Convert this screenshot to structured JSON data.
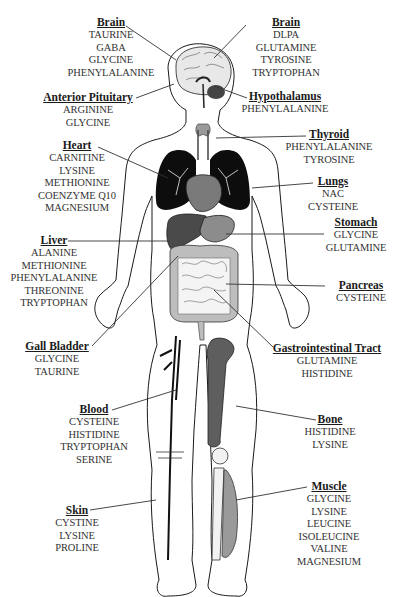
{
  "colors": {
    "outline": "#1a1a1a",
    "lungs": "#0d0d0d",
    "heart": "#7a7a7a",
    "liver": "#4a4a4a",
    "stomach": "#8c8c8c",
    "intestine": "#bdbdbd",
    "bone": "#5e5e5e",
    "muscle": "#9a9a9a",
    "thyroid": "#9a9a9a"
  },
  "labels": [
    {
      "id": "brain-left",
      "title": "Brain",
      "items": [
        "TAURINE",
        "GABA",
        "GLYCINE",
        "PHENYLALANINE"
      ]
    },
    {
      "id": "brain-right",
      "title": "Brain",
      "items": [
        "DLPA",
        "GLUTAMINE",
        "TYROSINE",
        "TRYPTOPHAN"
      ]
    },
    {
      "id": "anterior-pituitary",
      "title": "Anterior Pituitary",
      "items": [
        "ARGININE",
        "GLYCINE"
      ]
    },
    {
      "id": "hypothalamus",
      "title": "Hypothalamus",
      "items": [
        "PHENYLALANINE"
      ]
    },
    {
      "id": "thyroid",
      "title": "Thyroid",
      "items": [
        "PHENYLALANINE",
        "TYROSINE"
      ]
    },
    {
      "id": "heart",
      "title": "Heart",
      "items": [
        "CARNITINE",
        "LYSINE",
        "METHIONINE",
        "COENZYME Q10",
        "MAGNESIUM"
      ]
    },
    {
      "id": "lungs",
      "title": "Lungs",
      "items": [
        "NAC",
        "CYSTEINE"
      ]
    },
    {
      "id": "stomach",
      "title": "Stomach",
      "items": [
        "GLYCINE",
        "GLUTAMINE"
      ]
    },
    {
      "id": "liver",
      "title": "Liver",
      "items": [
        "ALANINE",
        "METHIONINE",
        "PHENYLALANINE",
        "THREONINE",
        "TRYPTOPHAN"
      ]
    },
    {
      "id": "pancreas",
      "title": "Pancreas",
      "items": [
        "CYSTEINE"
      ]
    },
    {
      "id": "gall-bladder",
      "title": "Gall Bladder",
      "items": [
        "GLYCINE",
        "TAURINE"
      ]
    },
    {
      "id": "gastrointestinal-tract",
      "title": "Gastrointestinal Tract",
      "items": [
        "GLUTAMINE",
        "HISTIDINE"
      ]
    },
    {
      "id": "blood",
      "title": "Blood",
      "items": [
        "CYSTEINE",
        "HISTIDINE",
        "TRYPTOPHAN",
        "SERINE"
      ]
    },
    {
      "id": "bone",
      "title": "Bone",
      "items": [
        "HISTIDINE",
        "LYSINE"
      ]
    },
    {
      "id": "skin",
      "title": "Skin",
      "items": [
        "CYSTINE",
        "LYSINE",
        "PROLINE"
      ]
    },
    {
      "id": "muscle",
      "title": "Muscle",
      "items": [
        "GLYCINE",
        "LYSINE",
        "LEUCINE",
        "ISOLEUCINE",
        "VALINE",
        "MAGNESIUM"
      ]
    }
  ]
}
